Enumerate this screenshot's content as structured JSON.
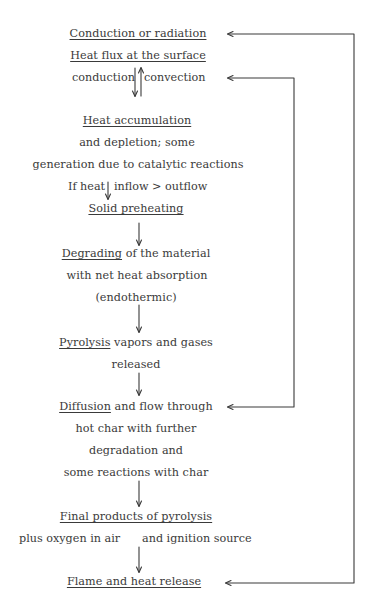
{
  "diagram": {
    "nodes": {
      "conduction_radiation": "Conduction or radiation",
      "heat_flux": "Heat flux at the surface",
      "conduction": "conduction",
      "convection": "convection",
      "heat_accumulation": "Heat accumulation",
      "and_depletion": "and depletion; some",
      "generation": "generation due to catalytic reactions",
      "if_heat": "If heat",
      "inflow_outflow": "inflow > outflow",
      "solid_preheating": "Solid preheating",
      "degrading": "Degrading",
      "degrading_rest": " of the material",
      "net_heat_absorption": "with net heat absorption",
      "endothermic": "(endothermic)",
      "pyrolysis": "Pyrolysis",
      "pyrolysis_rest": " vapors and gases",
      "released": "released",
      "diffusion": "Diffusion",
      "diffusion_rest": " and flow through",
      "hot_char": "hot char with further",
      "degradation_and": "degradation and",
      "reactions_char": "some reactions with char",
      "final_products": "Final products of pyrolysis",
      "plus_oxygen": "plus oxygen in air",
      "ignition_source": "and ignition source",
      "flame": "Flame and heat release"
    },
    "feedback_loops": [
      {
        "from": "Diffusion and flow through",
        "to": "convection"
      },
      {
        "from": "Flame and heat release",
        "to": "Conduction or radiation"
      }
    ],
    "colors": {
      "ink": "#3a3a3a",
      "background": "#ffffff"
    }
  }
}
